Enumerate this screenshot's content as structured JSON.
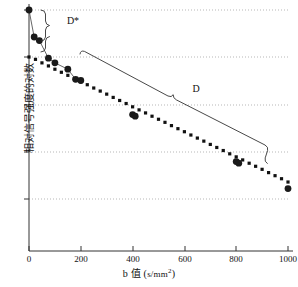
{
  "chart_data": {
    "type": "scatter",
    "title": "",
    "xlabel": "b 值 ( s/mm2 )",
    "xlabel_prefix": "b 值 (",
    "xlabel_unit": "s/mm",
    "xlabel_exponent": "2",
    "xlabel_suffix": ")",
    "ylabel": "相对信号强度的对数",
    "xlim": [
      0,
      1000
    ],
    "xticks": [
      0,
      200,
      400,
      600,
      800,
      1000
    ],
    "xticklabels": [
      "0",
      "200",
      "400",
      "600",
      "800",
      "1000"
    ],
    "yticks_count": 5,
    "yticklabels": [
      "",
      "",
      "",
      "",
      ""
    ],
    "ylim": [
      0,
      1
    ],
    "grid": "horizontal-dotted",
    "legend": "none",
    "series": [
      {
        "name": "measured-signal",
        "marker": "filled-circle",
        "connected_low_b": true,
        "points": [
          {
            "x": 0,
            "y": 1.0
          },
          {
            "x": 20,
            "y": 0.885
          },
          {
            "x": 40,
            "y": 0.87
          },
          {
            "x": 75,
            "y": 0.795
          },
          {
            "x": 100,
            "y": 0.775
          },
          {
            "x": 150,
            "y": 0.748
          },
          {
            "x": 180,
            "y": 0.705
          },
          {
            "x": 200,
            "y": 0.7
          },
          {
            "x": 400,
            "y": 0.555
          },
          {
            "x": 410,
            "y": 0.548
          },
          {
            "x": 800,
            "y": 0.355
          },
          {
            "x": 810,
            "y": 0.348
          },
          {
            "x": 1000,
            "y": 0.24
          }
        ]
      },
      {
        "name": "fitted-mono-exponential",
        "marker": "small-square-dot",
        "points": [
          {
            "x": 0,
            "y": 0.8
          },
          {
            "x": 25,
            "y": 0.79
          },
          {
            "x": 50,
            "y": 0.775
          },
          {
            "x": 75,
            "y": 0.762
          },
          {
            "x": 100,
            "y": 0.748
          },
          {
            "x": 125,
            "y": 0.735
          },
          {
            "x": 150,
            "y": 0.722
          },
          {
            "x": 175,
            "y": 0.708
          },
          {
            "x": 200,
            "y": 0.695
          },
          {
            "x": 225,
            "y": 0.682
          },
          {
            "x": 250,
            "y": 0.668
          },
          {
            "x": 275,
            "y": 0.655
          },
          {
            "x": 300,
            "y": 0.642
          },
          {
            "x": 325,
            "y": 0.628
          },
          {
            "x": 350,
            "y": 0.615
          },
          {
            "x": 375,
            "y": 0.602
          },
          {
            "x": 400,
            "y": 0.588
          },
          {
            "x": 425,
            "y": 0.575
          },
          {
            "x": 450,
            "y": 0.562
          },
          {
            "x": 475,
            "y": 0.548
          },
          {
            "x": 500,
            "y": 0.535
          },
          {
            "x": 525,
            "y": 0.522
          },
          {
            "x": 550,
            "y": 0.508
          },
          {
            "x": 575,
            "y": 0.495
          },
          {
            "x": 600,
            "y": 0.482
          },
          {
            "x": 625,
            "y": 0.468
          },
          {
            "x": 650,
            "y": 0.455
          },
          {
            "x": 675,
            "y": 0.442
          },
          {
            "x": 700,
            "y": 0.428
          },
          {
            "x": 725,
            "y": 0.415
          },
          {
            "x": 750,
            "y": 0.402
          },
          {
            "x": 775,
            "y": 0.388
          },
          {
            "x": 800,
            "y": 0.375
          },
          {
            "x": 825,
            "y": 0.362
          },
          {
            "x": 850,
            "y": 0.348
          },
          {
            "x": 875,
            "y": 0.335
          },
          {
            "x": 900,
            "y": 0.322
          },
          {
            "x": 925,
            "y": 0.308
          },
          {
            "x": 950,
            "y": 0.295
          },
          {
            "x": 975,
            "y": 0.282
          },
          {
            "x": 1000,
            "y": 0.268
          }
        ]
      }
    ],
    "annotations": [
      {
        "name": "d-star",
        "label": "D*",
        "description": "curly brace spanning fast perfusion component at low b values"
      },
      {
        "name": "d",
        "label": "D",
        "description": "slanted curly brace spanning slow diffusion component across b range"
      }
    ]
  }
}
